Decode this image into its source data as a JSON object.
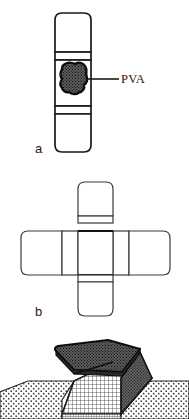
{
  "figure": {
    "background_color": "#ffffff",
    "ink_color": "#1a1a1a",
    "panels": [
      {
        "id": "a",
        "letter": "a",
        "description": "Vertical rectangular strip with rounded ends, divided by horizontal fold lines, containing a dark stippled PVA blob in the central segment",
        "callout": {
          "label": "PVA",
          "target": "pva-blob",
          "leader_line": true
        },
        "segments": [
          {
            "name": "top-segment",
            "fill": "#ffffff"
          },
          {
            "name": "upper-hinge-segment",
            "fill": "#ffffff"
          },
          {
            "name": "center-segment",
            "fill": "#ffffff"
          },
          {
            "name": "lower-hinge-segment",
            "fill": "#ffffff"
          },
          {
            "name": "bottom-segment",
            "fill": "#ffffff"
          }
        ],
        "blob": {
          "name": "pva-blob",
          "fill_pattern": "dense-stipple",
          "fill_color": "#4a4a4a",
          "outline_color": "#111111"
        }
      },
      {
        "id": "b",
        "letter": "b",
        "description": "Cruciform (plus-shaped) unfolded pattern: vertical strip crossing a horizontal strip, with fold lines at all four arm junctions",
        "arms": [
          {
            "name": "top-arm"
          },
          {
            "name": "bottom-arm"
          },
          {
            "name": "left-arm"
          },
          {
            "name": "right-arm"
          },
          {
            "name": "center-square"
          }
        ]
      },
      {
        "id": "c",
        "letter": "",
        "description": "Isometric three-dimensional view of the folded structure: a dark stippled lifted flap above a cross-hatched grid face, seated in a light dotted ground plane",
        "parts": [
          {
            "name": "ground-plane-left",
            "fill_pattern": "sparse-dots",
            "fill_color": "#f0f0f0"
          },
          {
            "name": "ground-plane-right",
            "fill_pattern": "sparse-dots",
            "fill_color": "#f0f0f0"
          },
          {
            "name": "lifted-flap-top",
            "fill_pattern": "dense-stipple",
            "fill_color": "#6e6e6e"
          },
          {
            "name": "grid-face",
            "fill_pattern": "cross-hatch-grid",
            "fill_color": "#d8d8d8"
          },
          {
            "name": "side-wall-dark",
            "fill_pattern": "dense-stipple",
            "fill_color": "#5a5a5a"
          },
          {
            "name": "front-edge-band",
            "fill_pattern": "fine-grid",
            "fill_color": "#cfcfcf"
          }
        ]
      }
    ]
  }
}
